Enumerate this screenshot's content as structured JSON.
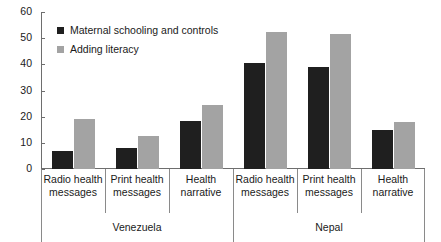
{
  "chart_data": {
    "type": "bar",
    "title": "",
    "subtitle": "",
    "xlabel": "",
    "ylabel": "",
    "ylim": [
      0,
      60
    ],
    "yticks": [
      0,
      10,
      20,
      30,
      40,
      50,
      60
    ],
    "ytick_labels": [
      "0",
      "10",
      "20",
      "30",
      "40",
      "50",
      "60"
    ],
    "grid": false,
    "legend_position": "upper-left-inside",
    "categories": [
      "Radio health messages",
      "Print health messages",
      "Health narrative",
      "Radio health messages",
      "Print health messages",
      "Health narrative"
    ],
    "category_lines": [
      [
        "Radio health",
        "messages"
      ],
      [
        "Print health",
        "messages"
      ],
      [
        "Health",
        "narrative"
      ],
      [
        "Radio health",
        "messages"
      ],
      [
        "Print health",
        "messages"
      ],
      [
        "Health",
        "narrative"
      ]
    ],
    "groups": [
      {
        "label": "Venezuela",
        "category_indices": [
          0,
          1,
          2
        ]
      },
      {
        "label": "Nepal",
        "category_indices": [
          3,
          4,
          5
        ]
      }
    ],
    "series": [
      {
        "name": "Maternal schooling and controls",
        "color": "#1f1f1f",
        "values": [
          7,
          8,
          18.5,
          40.5,
          39,
          15
        ]
      },
      {
        "name": "Adding literacy",
        "color": "#a3a3a3",
        "values": [
          19,
          12.5,
          24.5,
          52.5,
          51.5,
          18
        ]
      }
    ]
  },
  "legend": {
    "items": [
      {
        "label": "Maternal schooling and controls",
        "color": "#1f1f1f"
      },
      {
        "label": "Adding literacy",
        "color": "#a3a3a3"
      }
    ]
  },
  "colors": {
    "series_dark": "#1f1f1f",
    "series_light": "#a3a3a3",
    "axis": "#6e6e6e",
    "divider": "#8a8a8a",
    "background": "#ffffff",
    "text": "#1a1a1a"
  }
}
